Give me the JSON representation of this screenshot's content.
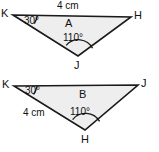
{
  "figure": {
    "background_color": "#ffffff",
    "fill_color": "#eeeeee",
    "stroke_color": "#1a1a1a",
    "width": 159,
    "height": 152
  },
  "triangles": [
    {
      "id": "triangle-a",
      "region_label": "A",
      "vertices": [
        {
          "name": "K",
          "label": "K",
          "x": 13,
          "y": 15
        },
        {
          "name": "H",
          "label": "H",
          "x": 131,
          "y": 17
        },
        {
          "name": "J",
          "label": "J",
          "x": 78,
          "y": 56
        }
      ],
      "angles": [
        {
          "at": "K",
          "label": "30°",
          "value": 30
        },
        {
          "at": "J",
          "label": "110°",
          "value": 110
        }
      ],
      "sides": [
        {
          "from": "K",
          "to": "H",
          "label": "4 cm",
          "length": 4,
          "unit": "cm"
        }
      ]
    },
    {
      "id": "triangle-b",
      "region_label": "B",
      "vertices": [
        {
          "name": "K",
          "label": "K",
          "x": 14,
          "y": 86
        },
        {
          "name": "J",
          "label": "J",
          "x": 138,
          "y": 85
        },
        {
          "name": "H",
          "label": "H",
          "x": 85,
          "y": 130
        }
      ],
      "angles": [
        {
          "at": "K",
          "label": "30°",
          "value": 30
        },
        {
          "at": "H",
          "label": "110°",
          "value": 110
        }
      ],
      "sides": [
        {
          "from": "K",
          "to": "H",
          "label": "4 cm",
          "length": 4,
          "unit": "cm"
        }
      ]
    }
  ],
  "labels": {
    "a_vertex_k": "K",
    "a_vertex_h": "H",
    "a_vertex_j": "J",
    "a_angle_k": "30°",
    "a_angle_j": "110°",
    "a_side_kh": "4 cm",
    "a_region": "A",
    "b_vertex_k": "K",
    "b_vertex_j": "J",
    "b_vertex_h": "H",
    "b_angle_k": "30°",
    "b_angle_h": "110°",
    "b_side_kh": "4 cm",
    "b_region": "B"
  }
}
